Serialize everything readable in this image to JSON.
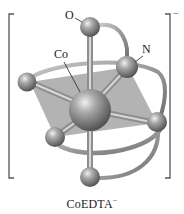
{
  "figure": {
    "caption": {
      "formula": "CoEDTA",
      "charge": "−"
    },
    "complex_charge": "−",
    "labels": {
      "oxygen": "O",
      "cobalt": "Co",
      "nitrogen": "N"
    },
    "geometry": "octahedral",
    "central_atom": "Co",
    "ligand": "EDTA",
    "colors": {
      "atom_fill": "#8a8a8a",
      "atom_highlight": "#e0e0e0",
      "bond": "#a8a8a8",
      "plane": "#9a9a9a",
      "ribbon": "#9c9c9c",
      "bracket": "#555555",
      "text": "#222222"
    }
  }
}
